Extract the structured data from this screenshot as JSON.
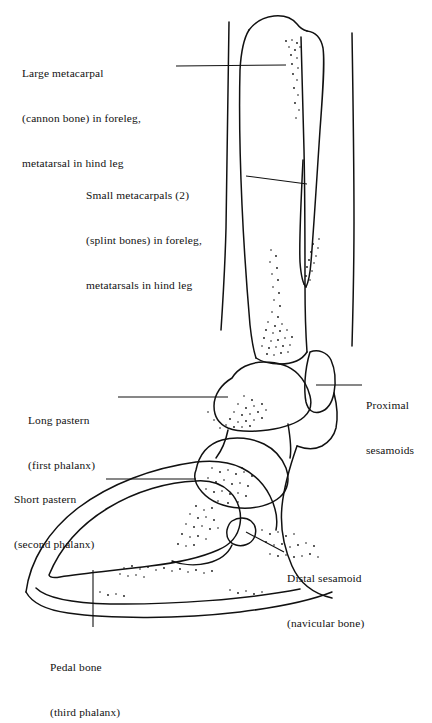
{
  "figure": {
    "ink_color": "#111111",
    "background_color": "#ffffff"
  },
  "labels": {
    "large_metacarpal": {
      "line1": "Large metacarpal",
      "line2": "(cannon bone) in foreleg,",
      "line3": "metatarsal in hind leg"
    },
    "small_metacarpals": {
      "line1": "Small metacarpals (2)",
      "line2": "(splint bones) in foreleg,",
      "line3": "metatarsals in hind leg"
    },
    "long_pastern": {
      "line1": "Long pastern",
      "line2": "(first phalanx)"
    },
    "short_pastern": {
      "line1": "Short pastern",
      "line2": "(second phalanx)"
    },
    "proximal_sesamoids": {
      "line1": "Proximal",
      "line2": "sesamoids"
    },
    "distal_sesamoid": {
      "line1": "Distal sesamoid",
      "line2": "(navicular bone)"
    },
    "pedal_bone": {
      "line1": "Pedal bone",
      "line2": "(third phalanx)"
    }
  }
}
